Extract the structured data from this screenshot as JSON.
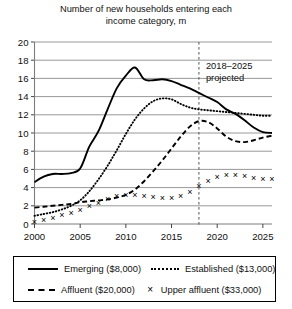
{
  "chart_data": {
    "type": "line",
    "title": "Number of new households entering each income category, m",
    "title_line1": "Number of new households entering each",
    "title_line2": "income category, m",
    "xlabel": "",
    "ylabel": "",
    "xlim": [
      2000,
      2026
    ],
    "ylim": [
      0,
      20
    ],
    "yticks": [
      0,
      2,
      4,
      6,
      8,
      10,
      12,
      14,
      16,
      18,
      20
    ],
    "xticks": [
      2000,
      2005,
      2010,
      2015,
      2020,
      2025
    ],
    "grid": true,
    "legend_position": "bottom",
    "annotations": [
      {
        "text": "2018–2025 projected",
        "line1": "2018–2025",
        "line2": "projected",
        "x": 2018,
        "type": "vertical-dashed-line-with-label"
      }
    ],
    "x": [
      2000,
      2001,
      2002,
      2003,
      2004,
      2005,
      2006,
      2007,
      2008,
      2009,
      2010,
      2011,
      2012,
      2013,
      2014,
      2015,
      2016,
      2017,
      2018,
      2019,
      2020,
      2021,
      2022,
      2023,
      2024,
      2025,
      2026
    ],
    "series": [
      {
        "name": "Emerging ($8,000)",
        "style": "solid",
        "values": [
          4.6,
          5.2,
          5.5,
          5.5,
          5.6,
          6.1,
          8.5,
          10.2,
          12.6,
          14.9,
          16.3,
          17.2,
          15.9,
          15.8,
          15.9,
          15.7,
          15.3,
          14.9,
          14.4,
          13.9,
          13.4,
          12.6,
          12.1,
          11.4,
          10.6,
          10.1,
          10.0
        ]
      },
      {
        "name": "Established ($13,000)",
        "style": "dotted",
        "values": [
          0.9,
          1.1,
          1.3,
          1.6,
          2.0,
          2.6,
          3.6,
          4.9,
          6.4,
          8.1,
          9.9,
          11.5,
          12.7,
          13.5,
          13.8,
          13.7,
          13.2,
          12.8,
          12.6,
          12.5,
          12.4,
          12.3,
          12.2,
          12.1,
          12.0,
          11.9,
          11.9
        ]
      },
      {
        "name": "Affluent ($20,000)",
        "style": "dashed",
        "values": [
          1.8,
          1.9,
          2.0,
          2.1,
          2.2,
          2.4,
          2.5,
          2.6,
          2.7,
          2.9,
          3.2,
          3.8,
          4.7,
          5.8,
          7.0,
          8.3,
          9.6,
          10.7,
          11.3,
          11.2,
          10.5,
          9.6,
          9.1,
          9.0,
          9.2,
          9.5,
          9.7
        ]
      },
      {
        "name": "Upper affluent ($33,000)",
        "style": "markers",
        "marker": "×",
        "values": [
          0.3,
          0.5,
          0.7,
          1.0,
          1.3,
          1.6,
          2.0,
          2.4,
          2.8,
          3.1,
          3.2,
          3.2,
          3.1,
          3.0,
          2.9,
          2.9,
          3.1,
          3.6,
          4.2,
          4.8,
          5.2,
          5.4,
          5.4,
          5.3,
          5.1,
          5.0,
          5.0
        ]
      }
    ]
  },
  "legend": {
    "items": [
      {
        "label": "Emerging ($8,000)",
        "style": "solid"
      },
      {
        "label": "Established ($13,000)",
        "style": "dotted"
      },
      {
        "label": "Affluent ($20,000)",
        "style": "dashed"
      },
      {
        "label": "Upper affluent ($33,000)",
        "style": "markers",
        "marker": "×"
      }
    ]
  }
}
